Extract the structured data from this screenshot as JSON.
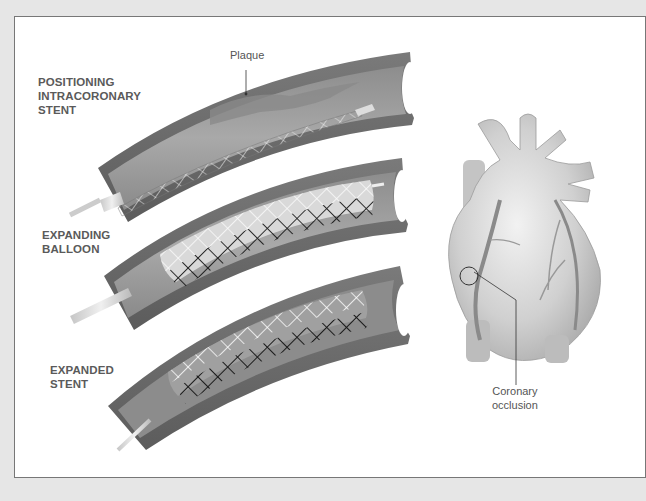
{
  "figure": {
    "panels": [
      {
        "id": "positioning",
        "label": "POSITIONING\nINTRACORONARY\nSTENT"
      },
      {
        "id": "expanding",
        "label": "EXPANDING\nBALLOON"
      },
      {
        "id": "expanded",
        "label": "EXPANDED\nSTENT"
      }
    ],
    "callouts": {
      "plaque": "Plaque",
      "occlusion": "Coronary\nocclusion"
    }
  },
  "colors": {
    "background": "#e6e6e6",
    "panel": "#ffffff",
    "vessel_wall": "#6b6b6b",
    "vessel_lumen": "#9a9a9a",
    "label_text": "#5a5a5a",
    "heart": "#c8c8c8"
  }
}
